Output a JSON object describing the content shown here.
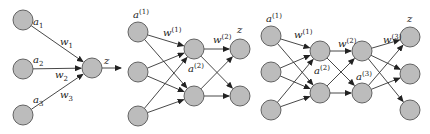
{
  "colors": {
    "node_fill": "#bcbcbc",
    "node_stroke": "#555555",
    "edge": "#333333",
    "text": "#222222"
  },
  "node_radius": 10,
  "networks": [
    {
      "name": "single-neuron",
      "nodes": [
        {
          "id": "a1",
          "x": 23,
          "y": 20
        },
        {
          "id": "a2",
          "x": 23,
          "y": 69
        },
        {
          "id": "a3",
          "x": 23,
          "y": 115
        },
        {
          "id": "z",
          "x": 92,
          "y": 68
        }
      ],
      "edges": [
        [
          "a1",
          "z"
        ],
        [
          "a2",
          "z"
        ],
        [
          "a3",
          "z"
        ]
      ],
      "extra_arrows": [
        {
          "x1": 102,
          "y1": 68,
          "x2": 121,
          "y2": 68
        }
      ],
      "labels": [
        {
          "base": "a",
          "sub": "1",
          "x": 33,
          "y": 25
        },
        {
          "base": "a",
          "sub": "2",
          "x": 33,
          "y": 63
        },
        {
          "base": "a",
          "sub": "3",
          "x": 33,
          "y": 103
        },
        {
          "base": "w",
          "sub": "1",
          "x": 60,
          "y": 45
        },
        {
          "base": "w",
          "sub": "2",
          "x": 55,
          "y": 78
        },
        {
          "base": "w",
          "sub": "3",
          "x": 60,
          "y": 98
        },
        {
          "base": "z",
          "sub": "",
          "x": 104,
          "y": 64
        }
      ]
    },
    {
      "name": "one-hidden-layer",
      "nodes": [
        {
          "id": "i1",
          "x": 138,
          "y": 32
        },
        {
          "id": "i2",
          "x": 138,
          "y": 72
        },
        {
          "id": "i3",
          "x": 138,
          "y": 116
        },
        {
          "id": "h1",
          "x": 194,
          "y": 49
        },
        {
          "id": "h2",
          "x": 194,
          "y": 96
        },
        {
          "id": "o1",
          "x": 240,
          "y": 49
        },
        {
          "id": "o2",
          "x": 240,
          "y": 96
        }
      ],
      "edges": [
        [
          "i1",
          "h1"
        ],
        [
          "i1",
          "h2"
        ],
        [
          "i2",
          "h1"
        ],
        [
          "i2",
          "h2"
        ],
        [
          "i3",
          "h1"
        ],
        [
          "i3",
          "h2"
        ],
        [
          "h1",
          "o1"
        ],
        [
          "h1",
          "o2"
        ],
        [
          "h2",
          "o1"
        ],
        [
          "h2",
          "o2"
        ]
      ],
      "extra_arrows": [],
      "labels": [
        {
          "base": "a",
          "sup": "(1)",
          "x": 133,
          "y": 18
        },
        {
          "base": "w",
          "sup": "(1)",
          "x": 163,
          "y": 36
        },
        {
          "base": "w",
          "sup": "(2)",
          "x": 213,
          "y": 43
        },
        {
          "base": "a",
          "sup": "(2)",
          "x": 188,
          "y": 72
        },
        {
          "base": "z",
          "sup": "",
          "x": 237,
          "y": 33
        }
      ]
    },
    {
      "name": "two-hidden-layers",
      "nodes": [
        {
          "id": "i1",
          "x": 271,
          "y": 36
        },
        {
          "id": "i2",
          "x": 271,
          "y": 72
        },
        {
          "id": "i3",
          "x": 271,
          "y": 110
        },
        {
          "id": "h1",
          "x": 320,
          "y": 51
        },
        {
          "id": "h2",
          "x": 320,
          "y": 93
        },
        {
          "id": "g1",
          "x": 362,
          "y": 51
        },
        {
          "id": "g2",
          "x": 362,
          "y": 93
        },
        {
          "id": "o1",
          "x": 410,
          "y": 37
        },
        {
          "id": "o2",
          "x": 410,
          "y": 74
        },
        {
          "id": "o3",
          "x": 410,
          "y": 110
        }
      ],
      "edges": [
        [
          "i1",
          "h1"
        ],
        [
          "i1",
          "h2"
        ],
        [
          "i2",
          "h1"
        ],
        [
          "i2",
          "h2"
        ],
        [
          "i3",
          "h1"
        ],
        [
          "i3",
          "h2"
        ],
        [
          "h1",
          "g1"
        ],
        [
          "h1",
          "g2"
        ],
        [
          "h2",
          "g1"
        ],
        [
          "h2",
          "g2"
        ],
        [
          "g1",
          "o1"
        ],
        [
          "g1",
          "o2"
        ],
        [
          "g1",
          "o3"
        ],
        [
          "g2",
          "o1"
        ],
        [
          "g2",
          "o2"
        ]
      ],
      "extra_arrows": [],
      "labels": [
        {
          "base": "a",
          "sup": "(1)",
          "x": 266,
          "y": 22
        },
        {
          "base": "w",
          "sup": "(1)",
          "x": 294,
          "y": 38
        },
        {
          "base": "w",
          "sup": "(2)",
          "x": 338,
          "y": 47
        },
        {
          "base": "w",
          "sup": "(3)",
          "x": 383,
          "y": 43
        },
        {
          "base": "a",
          "sup": "(2)",
          "x": 314,
          "y": 74
        },
        {
          "base": "a",
          "sup": "(3)",
          "x": 356,
          "y": 80
        },
        {
          "base": "z",
          "sup": "",
          "x": 407,
          "y": 22
        }
      ]
    }
  ]
}
